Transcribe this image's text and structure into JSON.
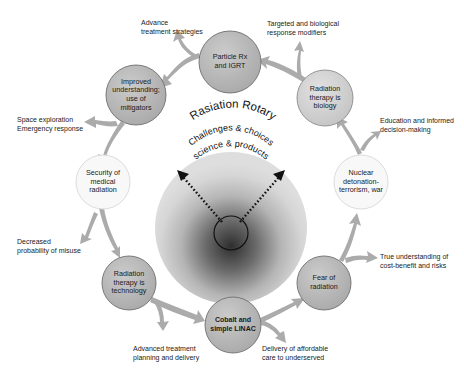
{
  "title": "Rasiation Rotary",
  "center": {
    "line1": "Challenges & choices",
    "line2": "science & products"
  },
  "colors": {
    "dark_node": "#b4b4b4",
    "mid_node": "#cfcfcf",
    "light_node": "#f7f7f7",
    "arrow": "#a8a8a8",
    "center_outer": "#dcdcdc",
    "center_core": "#3a3a3a"
  },
  "nodes": [
    {
      "id": "particle",
      "label": "Particle Rx\nand IGRT",
      "cx": 230,
      "cy": 62,
      "r": 31,
      "shade": "dark_node"
    },
    {
      "id": "biology",
      "label": "Radiation\ntherapy is\nbiology",
      "cx": 325,
      "cy": 98,
      "r": 28,
      "shade": "mid_node"
    },
    {
      "id": "nuclear",
      "label": "Nuclear\ndetonation-\nterrorism, war",
      "cx": 361,
      "cy": 182,
      "r": 27,
      "shade": "light_node"
    },
    {
      "id": "fear",
      "label": "Fear of\nradiation",
      "cx": 324,
      "cy": 283,
      "r": 27,
      "shade": "dark_node"
    },
    {
      "id": "cobalt",
      "label": "Cobalt and\nsimple LINAC",
      "cx": 233,
      "cy": 325,
      "r": 28,
      "shade": "dark_node"
    },
    {
      "id": "technology",
      "label": "Radiation\ntherapy is\ntechnology",
      "cx": 129,
      "cy": 283,
      "r": 27,
      "shade": "dark_node"
    },
    {
      "id": "security",
      "label": "Security of\nmedical\nradiation",
      "cx": 103,
      "cy": 182,
      "r": 27,
      "shade": "light_node"
    },
    {
      "id": "improved",
      "label": "Improved\nunderstanding;\nuse of\nmitigators",
      "cx": 136,
      "cy": 95,
      "r": 30,
      "shade": "dark_node"
    }
  ],
  "outcomes": [
    {
      "id": "advance",
      "text": "Advance\ntreatment strategies",
      "x": 141,
      "y": 20
    },
    {
      "id": "targeted",
      "text": "Targeted and biological\nresponse modifiers",
      "x": 267,
      "y": 21
    },
    {
      "id": "education",
      "text": "Education and informed\ndecision-making",
      "x": 380,
      "y": 118
    },
    {
      "id": "true_understanding",
      "text": "True understanding of\ncost-benefit and risks",
      "x": 380,
      "y": 254
    },
    {
      "id": "delivery",
      "text": "Delivery of affordable\ncare to underserved",
      "x": 262,
      "y": 346
    },
    {
      "id": "advanced_planning",
      "text": "Advanced treatment\nplanning and delivery",
      "x": 133,
      "y": 346
    },
    {
      "id": "decreased",
      "text": "Decreased\nprobability of misuse",
      "x": 17,
      "y": 239
    },
    {
      "id": "space",
      "text": "Space exploration\nEmergency response",
      "x": 17,
      "y": 117
    }
  ]
}
